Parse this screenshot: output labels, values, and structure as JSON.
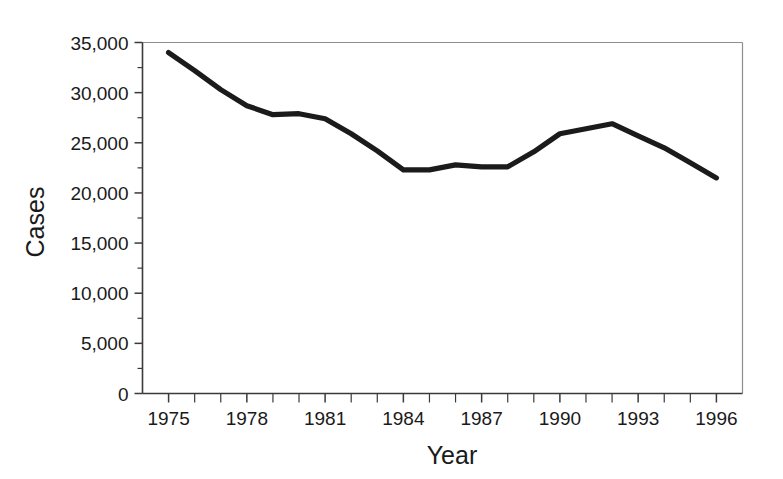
{
  "chart_data": {
    "type": "line",
    "title": "",
    "subtitle": "",
    "xlabel": "Year",
    "ylabel": "Cases",
    "x": [
      1975,
      1976,
      1977,
      1978,
      1979,
      1980,
      1981,
      1982,
      1983,
      1984,
      1985,
      1986,
      1987,
      1988,
      1989,
      1990,
      1991,
      1992,
      1993,
      1994,
      1995,
      1996
    ],
    "values": [
      34000,
      32200,
      30300,
      28700,
      27800,
      27900,
      27400,
      25900,
      24200,
      22300,
      22300,
      22800,
      22600,
      22600,
      24100,
      25900,
      26400,
      26900,
      25700,
      24500,
      23000,
      21500
    ],
    "series": [
      {
        "name": "Cases",
        "color": "#1b1b1b",
        "values": [
          34000,
          32200,
          30300,
          28700,
          27800,
          27900,
          27400,
          25900,
          24200,
          22300,
          22300,
          22800,
          22600,
          22600,
          24100,
          25900,
          26400,
          26900,
          25700,
          24500,
          23000,
          21500
        ]
      }
    ],
    "xlim": [
      1974,
      1997
    ],
    "ylim": [
      0,
      35000
    ],
    "x_tick_labels": [
      "1975",
      "1978",
      "1981",
      "1984",
      "1987",
      "1990",
      "1993",
      "1996"
    ],
    "x_tick_label_values": [
      1975,
      1978,
      1981,
      1984,
      1987,
      1990,
      1993,
      1996
    ],
    "x_minor_tick_values": [
      1975,
      1976,
      1977,
      1978,
      1979,
      1980,
      1981,
      1982,
      1983,
      1984,
      1985,
      1986,
      1987,
      1988,
      1989,
      1990,
      1991,
      1992,
      1993,
      1994,
      1995,
      1996
    ],
    "y_tick_labels": [
      "0",
      "5,000",
      "10,000",
      "15,000",
      "20,000",
      "25,000",
      "30,000",
      "35,000"
    ],
    "y_tick_label_values": [
      0,
      5000,
      10000,
      15000,
      20000,
      25000,
      30000,
      35000
    ],
    "y_minor_tick_values": [
      2500,
      7500,
      12500,
      17500,
      22500,
      27500,
      32500
    ],
    "grid": false,
    "legend": false,
    "legend_position": "none",
    "annotations": []
  },
  "colors": {
    "line": "#1b1b1b",
    "axis": "#3a3a3a",
    "frame": "#8d8d8d",
    "text": "#1a1a1a",
    "background": "#ffffff"
  }
}
